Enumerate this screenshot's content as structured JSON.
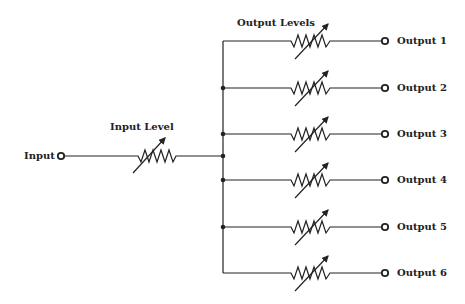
{
  "diagram": {
    "type": "circuit-schematic",
    "input": {
      "label": "Input",
      "control_label": "Input Level"
    },
    "output_group_label": "Output Levels",
    "outputs": [
      {
        "label": "Output 1"
      },
      {
        "label": "Output 2"
      },
      {
        "label": "Output 3"
      },
      {
        "label": "Output 4"
      },
      {
        "label": "Output 5"
      },
      {
        "label": "Output 6"
      }
    ],
    "components": {
      "input_potentiometer": "variable-resistor",
      "output_potentiometers": [
        "variable-resistor",
        "variable-resistor",
        "variable-resistor",
        "variable-resistor",
        "variable-resistor",
        "variable-resistor"
      ]
    },
    "colors": {
      "line": "#222222",
      "background": "#ffffff"
    }
  }
}
